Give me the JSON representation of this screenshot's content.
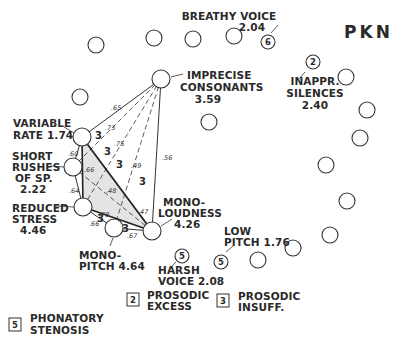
{
  "title": "PKN",
  "labels": {
    "breathy": {
      "line1": "BREATHY VOICE",
      "line2": "2.04",
      "badge": "6"
    },
    "imprecise": {
      "line1": "IMPRECISE",
      "line2": "CONSONANTS",
      "line3": "3.59"
    },
    "inappr": {
      "line1": "INAPPR.",
      "line2": "SILENCES",
      "line3": "2.40",
      "badge": "2"
    },
    "variable": {
      "line1": "VARIABLE",
      "line2": "RATE 1.74"
    },
    "short": {
      "line1": "SHORT",
      "line2": "RUSHES",
      "line3": "OF SP.",
      "line4": "2.22"
    },
    "reduced": {
      "line1": "REDUCED",
      "line2": "STRESS",
      "line3": "4.46"
    },
    "monoloud": {
      "line1": "MONO-",
      "line2": "LOUDNESS",
      "line3": "4.26"
    },
    "monopitch": {
      "line1": "MONO-",
      "line2": "PITCH 4.64"
    },
    "lowpitch": {
      "line1": "LOW",
      "line2": "PITCH 1.76",
      "badge": "5"
    },
    "harsh": {
      "line1": "HARSH",
      "line2": "VOICE 2.08",
      "badge": "5"
    }
  },
  "correlations": {
    "ic_vr": ".65",
    "ic_sr": ".73",
    "ic_rs": ".75",
    "ic_mp": ".49",
    "ic_ml": ".56",
    "vr_sr": ".60",
    "sr_rs": ".64",
    "sr_ml": ".66",
    "vr_ml": ".48",
    "rs_ml": ".78",
    "rs_mp": ".66",
    "mp_ml": ".67",
    "ml_47": ".47"
  },
  "cluster_marks": [
    "3",
    "3",
    "3",
    "3",
    "3",
    "3",
    "3"
  ],
  "legend": [
    {
      "badge": "2",
      "line1": "PROSODIC",
      "line2": "EXCESS"
    },
    {
      "badge": "3",
      "line1": "PROSODIC",
      "line2": "INSUFF."
    },
    {
      "badge": "5",
      "line1": "PHONATORY",
      "line2": "STENOSIS"
    }
  ]
}
